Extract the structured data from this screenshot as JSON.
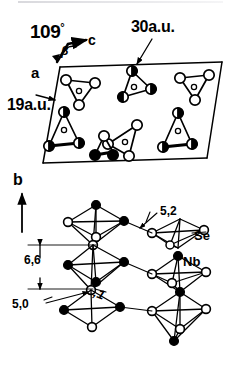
{
  "figure": {
    "type": "crystal-structure-diagram",
    "line_color": "#000000",
    "background": "#ffffff"
  },
  "top_panel": {
    "name": "unit-cell-projection",
    "angle_label": "109",
    "angle_degree_symbol": "°",
    "beta_label": "β",
    "axis_c_label": "c",
    "axis_a_label": "a",
    "cell_edge_top_label": "30a.u.",
    "cell_edge_left_label": "19a.u.",
    "clusters": [
      {
        "id": "c1",
        "cx": 79,
        "cy": 90,
        "r": 20,
        "rot": 0,
        "vertex_fill": [
          "open",
          "open",
          "open"
        ],
        "center": "small-open"
      },
      {
        "id": "c2",
        "cx": 131,
        "cy": 84,
        "r": 20,
        "rot": 12,
        "vertex_fill": [
          "half",
          "half",
          "half"
        ],
        "center": "small-open"
      },
      {
        "id": "c3",
        "cx": 193,
        "cy": 88,
        "r": 20,
        "rot": 0,
        "vertex_fill": [
          "open",
          "open",
          "open"
        ],
        "center": "small-open"
      },
      {
        "id": "c4",
        "cx": 63,
        "cy": 135,
        "r": 20,
        "rot": 0,
        "vertex_fill": [
          "half",
          "half",
          "half"
        ],
        "center": "small-open"
      },
      {
        "id": "c5",
        "cx": 124,
        "cy": 140,
        "r": 20,
        "rot": 200,
        "vertex_fill": [
          "open",
          "open",
          "open"
        ],
        "center": "small-open"
      },
      {
        "id": "c6",
        "cx": 178,
        "cy": 133,
        "r": 20,
        "rot": 0,
        "vertex_fill": [
          "half",
          "half",
          "half"
        ],
        "center": "small-open"
      }
    ]
  },
  "bottom_panel": {
    "name": "polyhedral-chain-projection",
    "axis_b_label": "b",
    "atom_labels": {
      "selenium": "Se",
      "niobium": "Nb"
    },
    "distance_labels": [
      {
        "value": "5,2",
        "name": "distance-52"
      },
      {
        "value": "6,6",
        "name": "distance-66"
      },
      {
        "value": "5,0",
        "name": "distance-50"
      },
      {
        "value": "8,1",
        "name": "distance-81"
      }
    ]
  },
  "legend": {
    "open_circle": "Se",
    "filled_circle": "Nb",
    "small_circle": "Nb (in triangle center)",
    "half_circle": "atom at different height"
  }
}
